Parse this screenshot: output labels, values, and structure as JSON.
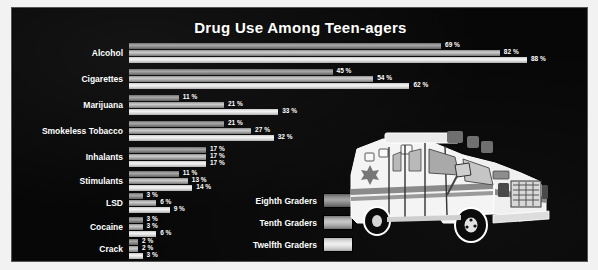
{
  "title": "Drug Use Among Teen-agers",
  "legend": {
    "items": [
      {
        "label": "Eighth Graders",
        "key": "g8",
        "color": "#8e8e8e"
      },
      {
        "label": "Tenth Graders",
        "key": "g10",
        "color": "#b8b8b8"
      },
      {
        "label": "Twelfth Graders",
        "key": "g12",
        "color": "#e8e8e8"
      }
    ]
  },
  "illustration": {
    "name": "ambulance-illustration"
  },
  "colors": {
    "background": "#070707",
    "page": "#f2f2f2",
    "text": "#ffffff",
    "eighth": "#8e8e8e",
    "tenth": "#b8b8b8",
    "twelfth": "#e8e8e8"
  },
  "chart_data": {
    "type": "bar",
    "title": "Drug Use Among Teen-agers",
    "xlabel": "",
    "ylabel": "",
    "orientation": "horizontal",
    "grid": false,
    "legend_position": "bottom-center",
    "xlim": [
      0,
      88
    ],
    "value_suffix": "%",
    "categories": [
      "Alcohol",
      "Cigarettes",
      "Marijuana",
      "Smokeless Tobacco",
      "Inhalants",
      "Stimulants",
      "LSD",
      "Cocaine",
      "Crack"
    ],
    "series": [
      {
        "name": "Eighth Graders",
        "values": [
          69,
          45,
          11,
          21,
          17,
          11,
          3,
          3,
          2
        ],
        "labels": [
          "69 %",
          "45 %",
          "11 %",
          "21 %",
          "17 %",
          "11 %",
          "3 %",
          "3 %",
          "2 %"
        ]
      },
      {
        "name": "Tenth Graders",
        "values": [
          82,
          54,
          21,
          27,
          17,
          13,
          6,
          3,
          2
        ],
        "labels": [
          "82 %",
          "54 %",
          "21 %",
          "27 %",
          "17 %",
          "13 %",
          "6 %",
          "3 %",
          "2 %"
        ]
      },
      {
        "name": "Twelfth Graders",
        "values": [
          88,
          62,
          33,
          32,
          17,
          14,
          9,
          6,
          3
        ],
        "labels": [
          "88 %",
          "62 %",
          "33 %",
          "32 %",
          "17 %",
          "14 %",
          "9 %",
          "6 %",
          "3 %"
        ]
      }
    ]
  }
}
